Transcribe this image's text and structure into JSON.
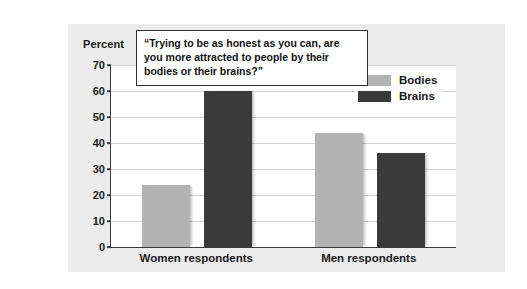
{
  "panel": {
    "background_color": "#ececec",
    "page_background_color": "#ffffff"
  },
  "axis_caption": "Percent",
  "title_box": {
    "text": "“Trying to be as honest as you can, are you more attracted to people by their bodies or their brains?”"
  },
  "legend": {
    "position": "top-right",
    "entries": [
      {
        "label": "Bodies",
        "color": "#b3b3b3"
      },
      {
        "label": "Brains",
        "color": "#3a3a3a"
      }
    ]
  },
  "chart_data": {
    "type": "bar",
    "title": "“Trying to be as honest as you can, are you more attracted to people by their bodies or their brains?”",
    "xlabel": "",
    "ylabel": "Percent",
    "categories": [
      "Women respondents",
      "Men respondents"
    ],
    "series": [
      {
        "name": "Bodies",
        "color": "#b3b3b3",
        "values": [
          24,
          44
        ]
      },
      {
        "name": "Brains",
        "color": "#3a3a3a",
        "values": [
          60,
          36
        ]
      }
    ],
    "ylim": [
      0,
      70
    ],
    "yticks": [
      0,
      10,
      20,
      30,
      40,
      50,
      60,
      70
    ],
    "ytick_labels": [
      "0",
      "10",
      "20",
      "30",
      "40",
      "50",
      "60",
      "70"
    ],
    "grid": "horizontal",
    "legend_position": "top-right"
  }
}
